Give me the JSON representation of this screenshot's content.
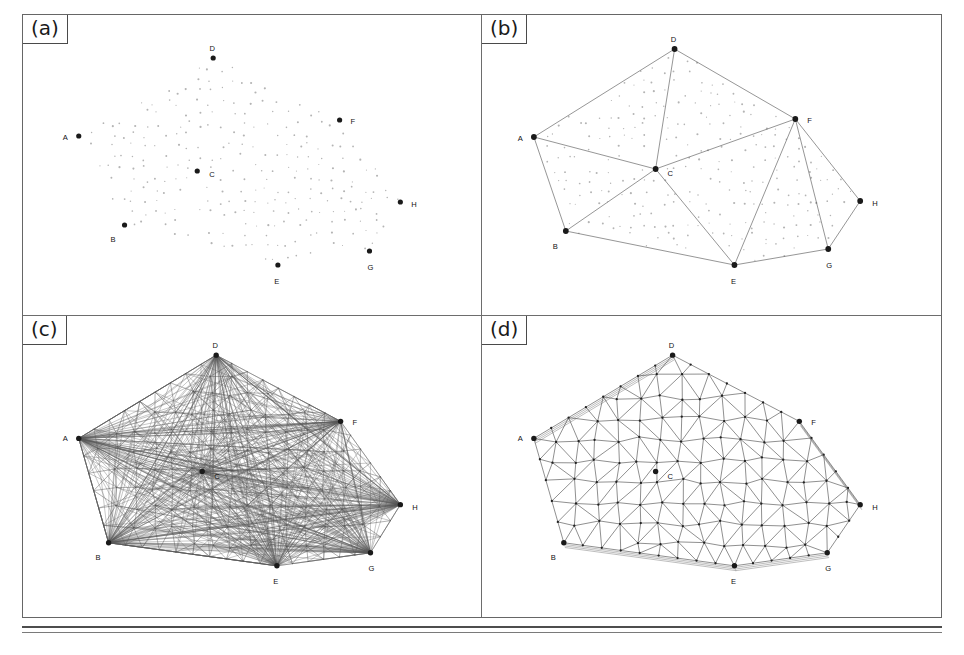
{
  "figure": {
    "panel_count": 4,
    "ink_color": "#1a1a1a",
    "grid_dot_color": "#b4b4b4",
    "edge_color": "#4f4f4f",
    "frame_color": "#666666"
  },
  "panels": [
    {
      "tag": "(a)",
      "name": "scattered-point-cloud",
      "caption": "Input point set with eight labelled boundary nodes"
    },
    {
      "tag": "(b)",
      "name": "boundary-constraint-graph",
      "caption": "Constrained boundary polygon and initial subdivision"
    },
    {
      "tag": "(c)",
      "name": "raw-triangulation",
      "caption": "Unfiltered triangulation with long sliver elements"
    },
    {
      "tag": "(d)",
      "name": "refined-delaunay-mesh",
      "caption": "Final quality-graded Delaunay triangulation"
    }
  ],
  "node_labels": [
    "A",
    "B",
    "C",
    "D",
    "E",
    "F",
    "G",
    "H"
  ],
  "chart_data": {
    "type": "diagram",
    "subtype": "mesh-generation",
    "nodes_a": [
      {
        "id": "A",
        "x": 78,
        "y": 135,
        "lx": -11,
        "ly": 2
      },
      {
        "id": "B",
        "x": 124,
        "y": 224,
        "lx": -9,
        "ly": 11
      },
      {
        "id": "C",
        "x": 197,
        "y": 170,
        "lx": 12,
        "ly": 4
      },
      {
        "id": "D",
        "x": 213,
        "y": 57,
        "lx": -1,
        "ly": -7
      },
      {
        "id": "E",
        "x": 278,
        "y": 264,
        "lx": -1,
        "ly": 13
      },
      {
        "id": "F",
        "x": 340,
        "y": 119,
        "lx": 11,
        "ly": 2
      },
      {
        "id": "G",
        "x": 370,
        "y": 250,
        "lx": 1,
        "ly": 13
      },
      {
        "id": "H",
        "x": 401,
        "y": 201,
        "lx": 11,
        "ly": 3
      }
    ],
    "nodes_b": [
      {
        "id": "A",
        "x": 534,
        "y": 136,
        "lx": -11,
        "ly": 2
      },
      {
        "id": "B",
        "x": 566,
        "y": 230,
        "lx": -8,
        "ly": 12
      },
      {
        "id": "C",
        "x": 656,
        "y": 168,
        "lx": 12,
        "ly": 5
      },
      {
        "id": "D",
        "x": 675,
        "y": 48,
        "lx": -1,
        "ly": -7
      },
      {
        "id": "E",
        "x": 735,
        "y": 264,
        "lx": -1,
        "ly": 13
      },
      {
        "id": "F",
        "x": 796,
        "y": 118,
        "lx": 12,
        "ly": 2
      },
      {
        "id": "G",
        "x": 829,
        "y": 248,
        "lx": 1,
        "ly": 13
      },
      {
        "id": "H",
        "x": 861,
        "y": 200,
        "lx": 12,
        "ly": 3
      }
    ],
    "edges_b": [
      [
        "A",
        "D"
      ],
      [
        "D",
        "F"
      ],
      [
        "F",
        "H"
      ],
      [
        "H",
        "G"
      ],
      [
        "G",
        "E"
      ],
      [
        "E",
        "B"
      ],
      [
        "B",
        "A"
      ],
      [
        "A",
        "C"
      ],
      [
        "C",
        "D"
      ],
      [
        "C",
        "F"
      ],
      [
        "C",
        "E"
      ],
      [
        "E",
        "F"
      ],
      [
        "F",
        "G"
      ],
      [
        "B",
        "C"
      ]
    ],
    "nodes_c": [
      {
        "id": "A",
        "x": 78,
        "y": 442,
        "lx": -11,
        "ly": 1
      },
      {
        "id": "B",
        "x": 108,
        "y": 546,
        "lx": -8,
        "ly": 12
      },
      {
        "id": "C",
        "x": 202,
        "y": 475,
        "lx": 12,
        "ly": 5
      },
      {
        "id": "D",
        "x": 216,
        "y": 359,
        "lx": -1,
        "ly": -7
      },
      {
        "id": "E",
        "x": 277,
        "y": 569,
        "lx": -1,
        "ly": 13
      },
      {
        "id": "F",
        "x": 341,
        "y": 425,
        "lx": 12,
        "ly": 2
      },
      {
        "id": "G",
        "x": 371,
        "y": 556,
        "lx": 1,
        "ly": 13
      },
      {
        "id": "H",
        "x": 401,
        "y": 508,
        "lx": 12,
        "ly": 3
      }
    ],
    "nodes_d": [
      {
        "id": "A",
        "x": 534,
        "y": 442,
        "lx": -11,
        "ly": 1
      },
      {
        "id": "B",
        "x": 564,
        "y": 546,
        "lx": -8,
        "ly": 12
      },
      {
        "id": "C",
        "x": 656,
        "y": 475,
        "lx": 12,
        "ly": 5
      },
      {
        "id": "D",
        "x": 673,
        "y": 359,
        "lx": -1,
        "ly": -7
      },
      {
        "id": "E",
        "x": 735,
        "y": 569,
        "lx": -1,
        "ly": 13
      },
      {
        "id": "F",
        "x": 800,
        "y": 425,
        "lx": 12,
        "ly": 2
      },
      {
        "id": "G",
        "x": 828,
        "y": 556,
        "lx": 1,
        "ly": 13
      },
      {
        "id": "H",
        "x": 861,
        "y": 508,
        "lx": 12,
        "ly": 3
      }
    ]
  }
}
